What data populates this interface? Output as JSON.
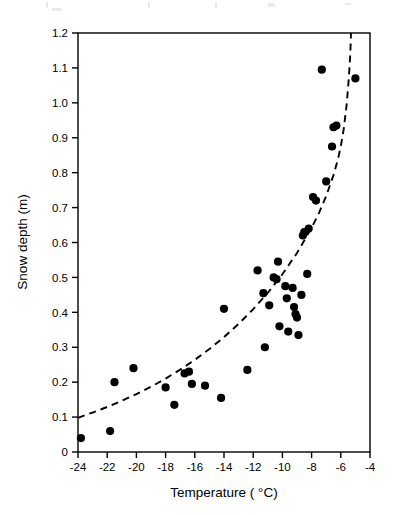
{
  "figure": {
    "background_color": "#ffffff",
    "ink_color": "#000000"
  },
  "axes": {
    "x": {
      "label": "Temperature ( °C)",
      "ticks": [
        "-24",
        "-22",
        "-20",
        "-18",
        "-16",
        "-14",
        "-12",
        "-10",
        "-8",
        "-6",
        "-4"
      ],
      "min": -24,
      "max": -4,
      "step": 2
    },
    "y": {
      "label": "Snow depth (m)",
      "ticks": [
        "0",
        "0.1",
        "0.2",
        "0.3",
        "0.4",
        "0.5",
        "0.6",
        "0.7",
        "0.8",
        "0.9",
        "1.0",
        "1.1",
        "1.2"
      ],
      "min": 0,
      "max": 1.2,
      "step": 0.1
    }
  },
  "chart_data": {
    "type": "scatter",
    "title": "",
    "xlabel": "Temperature ( °C)",
    "ylabel": "Snow depth (m)",
    "xlim": [
      -24,
      -4
    ],
    "ylim": [
      0,
      1.2
    ],
    "grid": false,
    "legend": null,
    "marker": {
      "shape": "circle",
      "color": "#000000",
      "size": 5
    },
    "points": [
      {
        "x": -23.8,
        "y": 0.04
      },
      {
        "x": -21.8,
        "y": 0.06
      },
      {
        "x": -21.5,
        "y": 0.2
      },
      {
        "x": -20.2,
        "y": 0.24
      },
      {
        "x": -18.0,
        "y": 0.185
      },
      {
        "x": -17.4,
        "y": 0.135
      },
      {
        "x": -16.7,
        "y": 0.225
      },
      {
        "x": -16.4,
        "y": 0.23
      },
      {
        "x": -16.2,
        "y": 0.195
      },
      {
        "x": -15.3,
        "y": 0.19
      },
      {
        "x": -14.2,
        "y": 0.155
      },
      {
        "x": -14.0,
        "y": 0.41
      },
      {
        "x": -12.4,
        "y": 0.235
      },
      {
        "x": -11.7,
        "y": 0.52
      },
      {
        "x": -11.3,
        "y": 0.455
      },
      {
        "x": -11.2,
        "y": 0.3
      },
      {
        "x": -10.9,
        "y": 0.42
      },
      {
        "x": -10.6,
        "y": 0.5
      },
      {
        "x": -10.4,
        "y": 0.495
      },
      {
        "x": -10.3,
        "y": 0.545
      },
      {
        "x": -10.2,
        "y": 0.36
      },
      {
        "x": -9.8,
        "y": 0.475
      },
      {
        "x": -9.7,
        "y": 0.44
      },
      {
        "x": -9.6,
        "y": 0.345
      },
      {
        "x": -9.3,
        "y": 0.47
      },
      {
        "x": -9.2,
        "y": 0.415
      },
      {
        "x": -9.1,
        "y": 0.395
      },
      {
        "x": -9.0,
        "y": 0.385
      },
      {
        "x": -8.9,
        "y": 0.335
      },
      {
        "x": -8.7,
        "y": 0.45
      },
      {
        "x": -8.6,
        "y": 0.62
      },
      {
        "x": -8.5,
        "y": 0.63
      },
      {
        "x": -8.3,
        "y": 0.51
      },
      {
        "x": -8.2,
        "y": 0.64
      },
      {
        "x": -7.9,
        "y": 0.73
      },
      {
        "x": -7.7,
        "y": 0.72
      },
      {
        "x": -7.3,
        "y": 1.095
      },
      {
        "x": -7.0,
        "y": 0.775
      },
      {
        "x": -6.6,
        "y": 0.875
      },
      {
        "x": -6.5,
        "y": 0.93
      },
      {
        "x": -6.3,
        "y": 0.935
      },
      {
        "x": -5.0,
        "y": 1.07
      }
    ],
    "fit_curve": {
      "style": "dashed",
      "color": "#000000",
      "description": "exponential trend line",
      "points": [
        {
          "x": -24.0,
          "y": 0.098
        },
        {
          "x": -23.0,
          "y": 0.113
        },
        {
          "x": -22.0,
          "y": 0.129
        },
        {
          "x": -21.0,
          "y": 0.147
        },
        {
          "x": -20.0,
          "y": 0.166
        },
        {
          "x": -19.0,
          "y": 0.187
        },
        {
          "x": -18.0,
          "y": 0.21
        },
        {
          "x": -17.0,
          "y": 0.236
        },
        {
          "x": -16.0,
          "y": 0.264
        },
        {
          "x": -15.0,
          "y": 0.295
        },
        {
          "x": -14.0,
          "y": 0.329
        },
        {
          "x": -13.0,
          "y": 0.367
        },
        {
          "x": -12.0,
          "y": 0.409
        },
        {
          "x": -11.0,
          "y": 0.456
        },
        {
          "x": -10.0,
          "y": 0.509
        },
        {
          "x": -9.0,
          "y": 0.57
        },
        {
          "x": -8.0,
          "y": 0.642
        },
        {
          "x": -7.5,
          "y": 0.684
        },
        {
          "x": -7.0,
          "y": 0.733
        },
        {
          "x": -6.5,
          "y": 0.793
        },
        {
          "x": -6.2,
          "y": 0.838
        },
        {
          "x": -6.0,
          "y": 0.875
        },
        {
          "x": -5.8,
          "y": 0.925
        },
        {
          "x": -5.6,
          "y": 0.995
        },
        {
          "x": -5.45,
          "y": 1.07
        },
        {
          "x": -5.35,
          "y": 1.14
        },
        {
          "x": -5.3,
          "y": 1.2
        }
      ]
    }
  }
}
